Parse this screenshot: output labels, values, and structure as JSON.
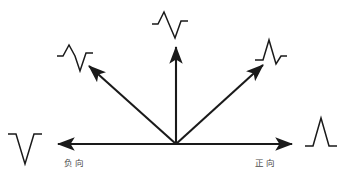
{
  "figure": {
    "type": "vector-polarity-diagram",
    "background_color": "#ffffff",
    "stroke_color": "#1a1a1a",
    "label_color": "#4a4a4a",
    "origin": {
      "x": 176,
      "y": 144
    }
  },
  "axis_labels": {
    "negative": "负向",
    "positive": "正向"
  },
  "arrows": [
    {
      "id": "left",
      "name": "negative-horizontal-arrow",
      "x1": 176,
      "y1": 144,
      "x2": 58,
      "y2": 144
    },
    {
      "id": "upper-left",
      "name": "upper-left-diagonal-arrow",
      "x1": 176,
      "y1": 144,
      "x2": 89,
      "y2": 66
    },
    {
      "id": "up",
      "name": "vertical-arrow",
      "x1": 176,
      "y1": 144,
      "x2": 176,
      "y2": 47
    },
    {
      "id": "upper-right",
      "name": "upper-right-diagonal-arrow",
      "x1": 176,
      "y1": 144,
      "x2": 263,
      "y2": 65
    },
    {
      "id": "right",
      "name": "positive-horizontal-arrow",
      "x1": 176,
      "y1": 144,
      "x2": 292,
      "y2": 144
    }
  ],
  "waveforms": [
    {
      "id": "far-left",
      "name": "waveform-fully-negative",
      "polarity": "fully negative",
      "transform": "translate(8,130)",
      "path": "M 0 4 L 8 4 L 17 34 L 26 4 L 34 4"
    },
    {
      "id": "upper-left",
      "name": "waveform-predominantly-negative",
      "polarity": "predominantly negative",
      "transform": "translate(57,44)",
      "path": "M 0 12 L 6 12 L 12 1 L 18 12 L 23 27 L 29 9 L 36 9"
    },
    {
      "id": "top-center",
      "name": "waveform-biphasic",
      "polarity": "biphasic equiphasic",
      "transform": "translate(152,10)",
      "path": "M 0 14 L 6 14 L 12 2 L 17 14 L 23 28 L 29 11 L 36 11"
    },
    {
      "id": "upper-right",
      "name": "waveform-predominantly-positive",
      "polarity": "predominantly positive",
      "transform": "translate(255,38)",
      "path": "M 0 22 L 8 22 L 14 2 L 21 26 L 26 18 L 32 18"
    },
    {
      "id": "far-right",
      "name": "waveform-fully-positive",
      "polarity": "fully positive",
      "transform": "translate(305,114)",
      "path": "M 0 32 L 8 32 L 16 4 L 24 32 L 32 32"
    }
  ]
}
